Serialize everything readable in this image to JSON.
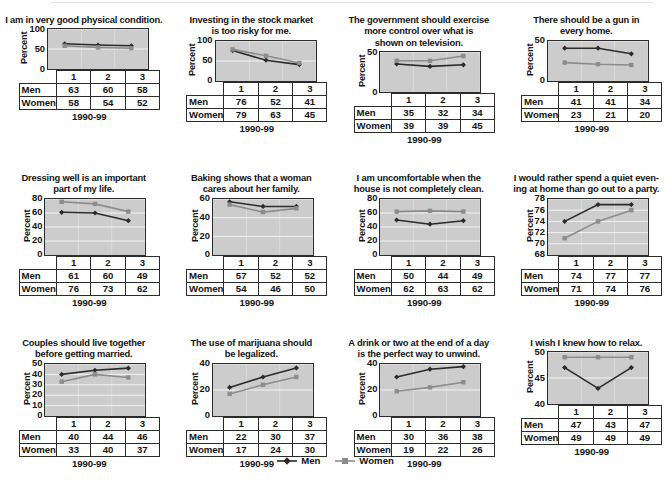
{
  "figure": {
    "series_names": [
      "Men",
      "Women"
    ],
    "colors": {
      "men": "#2b2b2b",
      "women": "#8c8c8c",
      "plot_bg": "#cccccc",
      "gridline": "#f2f2f2",
      "axis": "#2b2b2b"
    },
    "legend": {
      "men_label": "Men",
      "women_label": "Women",
      "men_marker": "diamond-marker",
      "women_marker": "square-marker"
    },
    "shared": {
      "ylabel": "Percent",
      "xlabel": "1990-99",
      "xticks": [
        "1",
        "2",
        "3"
      ],
      "row_label_men": "Men",
      "row_label_women": "Women"
    }
  },
  "chart_data": [
    {
      "type": "line",
      "title": "I am in very good physical condition.",
      "xlabel": "1990-99",
      "ylabel": "Percent",
      "x": [
        "1",
        "2",
        "3"
      ],
      "yticks": [
        0,
        50,
        100
      ],
      "ylim": [
        0,
        100
      ],
      "grid": true,
      "legend_position": "figure-bottom-center",
      "series": [
        {
          "name": "Men",
          "values": [
            63,
            60,
            58
          ]
        },
        {
          "name": "Women",
          "values": [
            58,
            54,
            52
          ]
        }
      ]
    },
    {
      "type": "line",
      "title": "Investing in the stock market\nis too risky for me.",
      "xlabel": "1990-99",
      "ylabel": "Percent",
      "x": [
        "1",
        "2",
        "3"
      ],
      "yticks": [
        0,
        50,
        100
      ],
      "ylim": [
        0,
        100
      ],
      "grid": true,
      "series": [
        {
          "name": "Men",
          "values": [
            76,
            52,
            41
          ]
        },
        {
          "name": "Women",
          "values": [
            79,
            63,
            45
          ]
        }
      ]
    },
    {
      "type": "line",
      "title": "The government should exercise\nmore control over what is\nshown on television.",
      "xlabel": "1990-99",
      "ylabel": "Percent",
      "x": [
        "1",
        "2",
        "3"
      ],
      "yticks": [
        0,
        50
      ],
      "ylim": [
        0,
        50
      ],
      "grid": true,
      "series": [
        {
          "name": "Men",
          "values": [
            35,
            32,
            34
          ]
        },
        {
          "name": "Women",
          "values": [
            39,
            39,
            45
          ]
        }
      ]
    },
    {
      "type": "line",
      "title": "There should be a gun in\nevery home.",
      "xlabel": "1990-99",
      "ylabel": "Percent",
      "x": [
        "1",
        "2",
        "3"
      ],
      "yticks": [
        0,
        50
      ],
      "ylim": [
        0,
        50
      ],
      "grid": true,
      "series": [
        {
          "name": "Men",
          "values": [
            41,
            41,
            34
          ]
        },
        {
          "name": "Women",
          "values": [
            23,
            21,
            20
          ]
        }
      ]
    },
    {
      "type": "line",
      "title": "Dressing well is an important\npart of my life.",
      "xlabel": "1990-99",
      "ylabel": "Percent",
      "x": [
        "1",
        "2",
        "3"
      ],
      "yticks": [
        0,
        20,
        40,
        60,
        80
      ],
      "ylim": [
        0,
        80
      ],
      "grid": true,
      "series": [
        {
          "name": "Men",
          "values": [
            61,
            60,
            49
          ]
        },
        {
          "name": "Women",
          "values": [
            76,
            73,
            62
          ]
        }
      ]
    },
    {
      "type": "line",
      "title": "Baking shows that a woman\ncares about her family.",
      "xlabel": "1990-99",
      "ylabel": "Percent",
      "x": [
        "1",
        "2",
        "3"
      ],
      "yticks": [
        0,
        20,
        40,
        60
      ],
      "ylim": [
        0,
        60
      ],
      "grid": true,
      "series": [
        {
          "name": "Men",
          "values": [
            57,
            52,
            52
          ]
        },
        {
          "name": "Women",
          "values": [
            54,
            46,
            50
          ]
        }
      ]
    },
    {
      "type": "line",
      "title": "I am uncomfortable when the\nhouse is not completely clean.",
      "xlabel": "1990-99",
      "ylabel": "Percent",
      "x": [
        "1",
        "2",
        "3"
      ],
      "yticks": [
        0,
        20,
        40,
        60,
        80
      ],
      "ylim": [
        0,
        80
      ],
      "grid": true,
      "series": [
        {
          "name": "Men",
          "values": [
            50,
            44,
            49
          ]
        },
        {
          "name": "Women",
          "values": [
            62,
            63,
            62
          ]
        }
      ]
    },
    {
      "type": "line",
      "title": "I would rather spend a quiet even-\ning at home than go out to a party.",
      "xlabel": "1990-99",
      "ylabel": "Percent",
      "x": [
        "1",
        "2",
        "3"
      ],
      "yticks": [
        68,
        70,
        72,
        74,
        76,
        78
      ],
      "ylim": [
        68,
        78
      ],
      "grid": true,
      "series": [
        {
          "name": "Men",
          "values": [
            74,
            77,
            77
          ]
        },
        {
          "name": "Women",
          "values": [
            71,
            74,
            76
          ]
        }
      ]
    },
    {
      "type": "line",
      "title": "Couples should live together\nbefore getting  married.",
      "xlabel": "1990-99",
      "ylabel": "Percent",
      "x": [
        "1",
        "2",
        "3"
      ],
      "yticks": [
        0,
        10,
        20,
        30,
        40,
        50
      ],
      "ylim": [
        0,
        50
      ],
      "grid": true,
      "series": [
        {
          "name": "Men",
          "values": [
            40,
            44,
            46
          ]
        },
        {
          "name": "Women",
          "values": [
            33,
            40,
            37
          ]
        }
      ]
    },
    {
      "type": "line",
      "title": "The use of marijuana should\nbe legalized.",
      "xlabel": "1990-99",
      "ylabel": "Percent",
      "x": [
        "1",
        "2",
        "3"
      ],
      "yticks": [
        0,
        20,
        40
      ],
      "ylim": [
        0,
        40
      ],
      "grid": true,
      "series": [
        {
          "name": "Men",
          "values": [
            22,
            30,
            37
          ]
        },
        {
          "name": "Women",
          "values": [
            17,
            24,
            30
          ]
        }
      ]
    },
    {
      "type": "line",
      "title": "A drink or two at the end of a day\nis the perfect way to unwind.",
      "xlabel": "1990-99",
      "ylabel": "Percent",
      "x": [
        "1",
        "2",
        "3"
      ],
      "yticks": [
        0,
        20,
        40
      ],
      "ylim": [
        0,
        40
      ],
      "grid": true,
      "series": [
        {
          "name": "Men",
          "values": [
            30,
            36,
            38
          ]
        },
        {
          "name": "Women",
          "values": [
            19,
            22,
            26
          ]
        }
      ]
    },
    {
      "type": "line",
      "title": "I wish I knew how to relax.",
      "xlabel": "1990-99",
      "ylabel": "Percent",
      "x": [
        "1",
        "2",
        "3"
      ],
      "yticks": [
        40,
        45,
        50
      ],
      "ylim": [
        40,
        50
      ],
      "grid": true,
      "series": [
        {
          "name": "Men",
          "values": [
            47,
            43,
            47
          ]
        },
        {
          "name": "Women",
          "values": [
            49,
            49,
            49
          ]
        }
      ]
    }
  ]
}
